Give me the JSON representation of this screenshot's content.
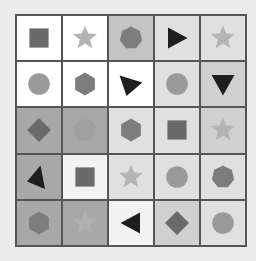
{
  "grid": {
    "rows": 5,
    "cols": 5,
    "cells": [
      [
        {
          "bg": "#ffffff",
          "shape": "square",
          "fill": "#6a6a6a"
        },
        {
          "bg": "#ffffff",
          "shape": "star",
          "fill": "#b4b4b4"
        },
        {
          "bg": "#c4c4c4",
          "shape": "heptagon",
          "fill": "#7d7d7d"
        },
        {
          "bg": "#e0e0e0",
          "shape": "triangle-right",
          "fill": "#1e1e1e"
        },
        {
          "bg": "#e0e0e0",
          "shape": "star",
          "fill": "#b4b4b4"
        }
      ],
      [
        {
          "bg": "#ffffff",
          "shape": "circle",
          "fill": "#9a9a9a"
        },
        {
          "bg": "#ffffff",
          "shape": "hexagon",
          "fill": "#7d7d7d"
        },
        {
          "bg": "#ffffff",
          "shape": "triangle-tilted",
          "fill": "#1e1e1e"
        },
        {
          "bg": "#e0e0e0",
          "shape": "circle",
          "fill": "#9a9a9a"
        },
        {
          "bg": "#d0d0d0",
          "shape": "triangle-down",
          "fill": "#1e1e1e"
        }
      ],
      [
        {
          "bg": "#a8a8a8",
          "shape": "diamond",
          "fill": "#6a6a6a"
        },
        {
          "bg": "#a8a8a8",
          "shape": "circle",
          "fill": "#a0a0a0"
        },
        {
          "bg": "#e0e0e0",
          "shape": "hexagon",
          "fill": "#7d7d7d"
        },
        {
          "bg": "#e0e0e0",
          "shape": "square",
          "fill": "#6a6a6a"
        },
        {
          "bg": "#d0d0d0",
          "shape": "star",
          "fill": "#b4b4b4"
        }
      ],
      [
        {
          "bg": "#a8a8a8",
          "shape": "triangle-left-tilted",
          "fill": "#1e1e1e"
        },
        {
          "bg": "#f2f2f2",
          "shape": "square",
          "fill": "#6a6a6a"
        },
        {
          "bg": "#e0e0e0",
          "shape": "star",
          "fill": "#b4b4b4"
        },
        {
          "bg": "#e0e0e0",
          "shape": "circle",
          "fill": "#9a9a9a"
        },
        {
          "bg": "#e0e0e0",
          "shape": "heptagon",
          "fill": "#7d7d7d"
        }
      ],
      [
        {
          "bg": "#a8a8a8",
          "shape": "hexagon",
          "fill": "#7d7d7d"
        },
        {
          "bg": "#a8a8a8",
          "shape": "star",
          "fill": "#b0b0b0"
        },
        {
          "bg": "#f2f2f2",
          "shape": "triangle-left",
          "fill": "#1e1e1e"
        },
        {
          "bg": "#d0d0d0",
          "shape": "diamond",
          "fill": "#6a6a6a"
        },
        {
          "bg": "#e0e0e0",
          "shape": "circle",
          "fill": "#9a9a9a"
        }
      ]
    ]
  }
}
